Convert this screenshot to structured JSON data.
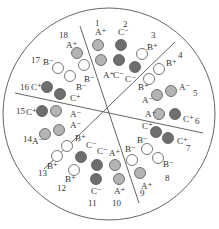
{
  "colors": {
    "phase_A": "#b4b4b4",
    "phase_B": "#ffffff",
    "phase_C": "#6e6e6e",
    "stroke": "#555555",
    "outline": "#666666"
  },
  "outer_circle": {
    "cx": 109,
    "cy": 114,
    "r": 106
  },
  "divider_lines": [
    {
      "x1": 80,
      "y1": 26,
      "x2": 139,
      "y2": 203
    },
    {
      "x1": 44,
      "y1": 169,
      "x2": 175,
      "y2": 42
    },
    {
      "x1": 15,
      "y1": 93,
      "x2": 203,
      "y2": 133
    }
  ],
  "slots": [
    {
      "number": "1",
      "nx": 95,
      "ny": 26
    },
    {
      "number": "2",
      "nx": 123,
      "ny": 27
    },
    {
      "number": "3",
      "nx": 151,
      "ny": 38
    },
    {
      "number": "4",
      "nx": 178,
      "ny": 58
    },
    {
      "number": "5",
      "nx": 193,
      "ny": 96
    },
    {
      "number": "6",
      "nx": 195,
      "ny": 124
    },
    {
      "number": "7",
      "nx": 186,
      "ny": 151
    },
    {
      "number": "8",
      "nx": 165,
      "ny": 181
    },
    {
      "number": "9",
      "nx": 140,
      "ny": 196
    },
    {
      "number": "10",
      "nx": 112,
      "ny": 206
    },
    {
      "number": "11",
      "nx": 88,
      "ny": 206
    },
    {
      "number": "12",
      "nx": 57,
      "ny": 191
    },
    {
      "number": "13",
      "nx": 38,
      "ny": 176
    },
    {
      "number": "14",
      "nx": 23,
      "ny": 142
    },
    {
      "number": "15",
      "nx": 16,
      "ny": 114
    },
    {
      "number": "16",
      "nx": 20,
      "ny": 90
    },
    {
      "number": "17",
      "nx": 31,
      "ny": 63
    },
    {
      "number": "18",
      "nx": 59,
      "ny": 38
    }
  ],
  "conductors": [
    {
      "slot": "1",
      "phase": "A",
      "label": "A⁺",
      "cx": 98,
      "cy": 45,
      "lx": 95,
      "ly": 35
    },
    {
      "slot": "1",
      "phase": "A",
      "label": "A⁺",
      "cx": 101,
      "cy": 60,
      "lx": 103,
      "ly": 78
    },
    {
      "slot": "2",
      "phase": "C",
      "label": "C⁻",
      "cx": 121,
      "cy": 45,
      "lx": 118,
      "ly": 35
    },
    {
      "slot": "2",
      "phase": "C",
      "label": "C⁻",
      "cx": 119,
      "cy": 60,
      "lx": 113,
      "ly": 78
    },
    {
      "slot": "3",
      "phase": "B",
      "label": "B⁺",
      "cx": 142,
      "cy": 54,
      "lx": 147,
      "ly": 50
    },
    {
      "slot": "3",
      "phase": "C",
      "label": "C⁻",
      "cx": 135,
      "cy": 67,
      "lx": 125,
      "ly": 82
    },
    {
      "slot": "4",
      "phase": "B",
      "label": "B⁺",
      "cx": 159,
      "cy": 69,
      "lx": 166,
      "ly": 66
    },
    {
      "slot": "4",
      "phase": "B",
      "label": "B⁺",
      "cx": 149,
      "cy": 79,
      "lx": 138,
      "ly": 90
    },
    {
      "slot": "5",
      "phase": "A",
      "label": "A⁻",
      "cx": 171,
      "cy": 91,
      "lx": 179,
      "ly": 90
    },
    {
      "slot": "5",
      "phase": "A",
      "label": "A⁻",
      "cx": 157,
      "cy": 95,
      "lx": 142,
      "ly": 103
    },
    {
      "slot": "6",
      "phase": "A",
      "label": "A⁻",
      "cx": 159,
      "cy": 114,
      "lx": 145,
      "ly": 117
    },
    {
      "slot": "6",
      "phase": "C",
      "label": "C⁺",
      "cx": 175,
      "cy": 114,
      "lx": 183,
      "ly": 122
    },
    {
      "slot": "7",
      "phase": "C",
      "label": "C⁺",
      "cx": 156,
      "cy": 132,
      "lx": 142,
      "ly": 129
    },
    {
      "slot": "7",
      "phase": "C",
      "label": "C⁺",
      "cx": 168,
      "cy": 138,
      "lx": 177,
      "ly": 144
    },
    {
      "slot": "8",
      "phase": "B",
      "label": "B⁻",
      "cx": 147,
      "cy": 149,
      "lx": 137,
      "ly": 143
    },
    {
      "slot": "8",
      "phase": "B",
      "label": "B⁻",
      "cx": 158,
      "cy": 158,
      "lx": 163,
      "ly": 167
    },
    {
      "slot": "9",
      "phase": "B",
      "label": "B⁻",
      "cx": 132,
      "cy": 160,
      "lx": 125,
      "ly": 152
    },
    {
      "slot": "9",
      "phase": "A",
      "label": "A⁺",
      "cx": 140,
      "cy": 173,
      "lx": 141,
      "ly": 189
    },
    {
      "slot": "10",
      "phase": "A",
      "label": "A⁺",
      "cx": 115,
      "cy": 165,
      "lx": 109,
      "ly": 156
    },
    {
      "slot": "10",
      "phase": "A",
      "label": "A⁺",
      "cx": 119,
      "cy": 179,
      "lx": 114,
      "ly": 194
    },
    {
      "slot": "11",
      "phase": "C",
      "label": "C⁻",
      "cx": 97,
      "cy": 165,
      "lx": 97,
      "ly": 154
    },
    {
      "slot": "11",
      "phase": "C",
      "label": "C⁻",
      "cx": 96,
      "cy": 179,
      "lx": 91,
      "ly": 194
    },
    {
      "slot": "12",
      "phase": "C",
      "label": "C⁻",
      "cx": 81,
      "cy": 157,
      "lx": 86,
      "ly": 148
    },
    {
      "slot": "12",
      "phase": "B",
      "label": "B⁺",
      "cx": 74,
      "cy": 170,
      "lx": 65,
      "ly": 182
    },
    {
      "slot": "13",
      "phase": "B",
      "label": "B⁺",
      "cx": 67,
      "cy": 146,
      "lx": 75,
      "ly": 141
    },
    {
      "slot": "13",
      "phase": "B",
      "label": "B⁺",
      "cx": 57,
      "cy": 156,
      "lx": 47,
      "ly": 169
    },
    {
      "slot": "14",
      "phase": "A",
      "label": "A⁻",
      "cx": 59,
      "cy": 130,
      "lx": 70,
      "ly": 128
    },
    {
      "slot": "14",
      "phase": "A",
      "label": "A⁻",
      "cx": 45,
      "cy": 134,
      "lx": 32,
      "ly": 144
    },
    {
      "slot": "15",
      "phase": "C",
      "label": "C⁺",
      "cx": 42,
      "cy": 111,
      "lx": 26,
      "ly": 115
    },
    {
      "slot": "15",
      "phase": "A",
      "label": "A⁻",
      "cx": 56,
      "cy": 111,
      "lx": 70,
      "ly": 117
    },
    {
      "slot": "16",
      "phase": "C",
      "label": "C⁺",
      "cx": 47,
      "cy": 87,
      "lx": 31,
      "ly": 90
    },
    {
      "slot": "16",
      "phase": "C",
      "label": "C⁺",
      "cx": 60,
      "cy": 94,
      "lx": 70,
      "ly": 101
    },
    {
      "slot": "17",
      "phase": "B",
      "label": "B⁻",
      "cx": 58,
      "cy": 68,
      "lx": 43,
      "ly": 65
    },
    {
      "slot": "17",
      "phase": "B",
      "label": "B⁻",
      "cx": 70,
      "cy": 76,
      "lx": 76,
      "ly": 90
    },
    {
      "slot": "18",
      "phase": "A",
      "label": "A⁺",
      "cx": 77,
      "cy": 53,
      "lx": 66,
      "ly": 48
    },
    {
      "slot": "18",
      "phase": "B",
      "label": "B⁻",
      "cx": 84,
      "cy": 65,
      "lx": 84,
      "ly": 82
    }
  ]
}
